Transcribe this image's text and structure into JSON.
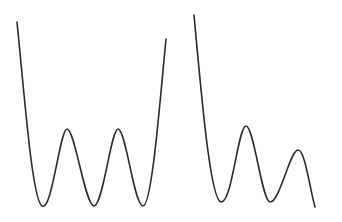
{
  "diagram": {
    "stroke_color": "#2b2b2b",
    "stroke_width": 1.6,
    "curves": [
      {
        "name": "symmetric-triple-well-potential",
        "description": "Three equal minima with two equal barriers",
        "path": "M17,22 C24,90 32,200 42,206 C52,212 60,129 67,129 C75,129 85,206 94,206 C103,206 111,129 118,129 C126,129 134,206 143,206 C152,206 160,100 166,39"
      },
      {
        "name": "tilted-multi-well-potential",
        "description": "Descending wells with decreasing barrier heights",
        "path": "M194,15 C201,90 210,200 221,202 C232,204 238,126 246,126 C254,126 262,202 270,202 C280,202 290,150 298,150 C305,150 309,185 315,207"
      }
    ]
  }
}
